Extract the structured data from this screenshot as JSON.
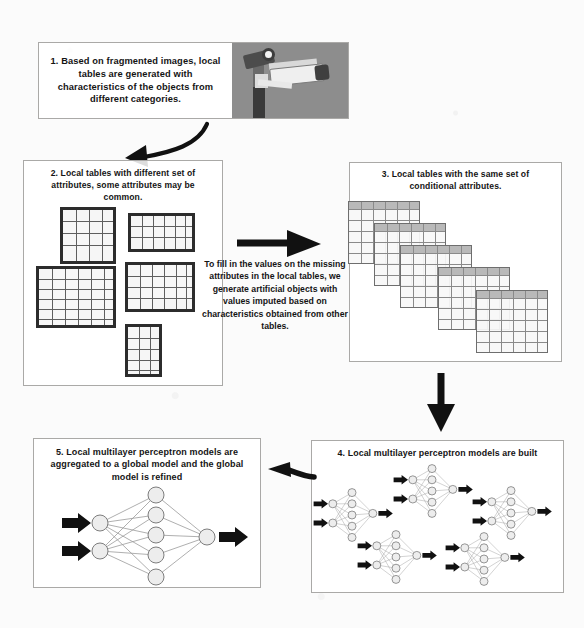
{
  "diagram": {
    "steps": [
      {
        "id": "step-1",
        "number": "1.",
        "text": "1. Based on fragmented images, local tables are generated with characteristics of the objects from different categories.",
        "image_alt": "surveillance-camera-photo"
      },
      {
        "id": "step-2",
        "number": "2.",
        "text": "2. Local tables with different set of attributes, some attributes may be common.",
        "tables_count": 5
      },
      {
        "id": "step-3",
        "number": "3.",
        "text": "3. Local tables with the same set of conditional attributes.",
        "tables_count": 5
      },
      {
        "id": "step-4",
        "number": "4.",
        "text": "4. Local multilayer perceptron models are built",
        "networks_count": 5
      },
      {
        "id": "step-5",
        "number": "5.",
        "text": "5. Local multilayer perceptron models are aggregated to a global model and the global model is refined",
        "networks_count": 1
      }
    ],
    "middle_note": "To fill in the values on the missing attributes in the local tables, we generate artificial objects with values imputed based on characteristics obtained from other tables.",
    "arrows": [
      {
        "name": "arrow-step1-to-step2",
        "direction": "down-left",
        "style": "curved"
      },
      {
        "name": "arrow-step2-to-step3",
        "direction": "right",
        "style": "thick-straight"
      },
      {
        "name": "arrow-step3-to-step4",
        "direction": "down",
        "style": "thick-straight"
      },
      {
        "name": "arrow-step4-to-step5",
        "direction": "left",
        "style": "thick-straight"
      }
    ],
    "colors": {
      "page_background": "#fbfbfb",
      "box_border": "#aaa9a7",
      "text": "#141414",
      "table_border": "#2c2c2c",
      "cascade_table_header": "#b9b9b9",
      "node_fill": "#ededed",
      "node_stroke": "#7d7d7d",
      "arrow": "#111111",
      "photo_background": "#8d8d8d"
    }
  }
}
